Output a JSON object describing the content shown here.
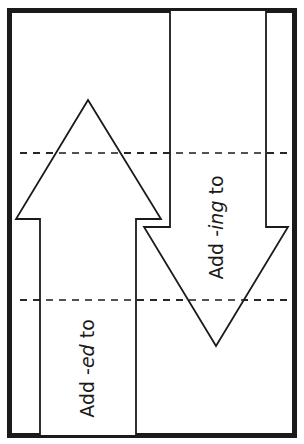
{
  "foldable": {
    "up_arrow": {
      "prefix": "Add -",
      "suffix_italic": "ed",
      "postfix": " to"
    },
    "down_arrow": {
      "prefix": "Add -",
      "suffix_italic": "ing",
      "postfix": " to"
    }
  },
  "colors": {
    "stroke": "#1a1a1a",
    "background": "#ffffff"
  }
}
